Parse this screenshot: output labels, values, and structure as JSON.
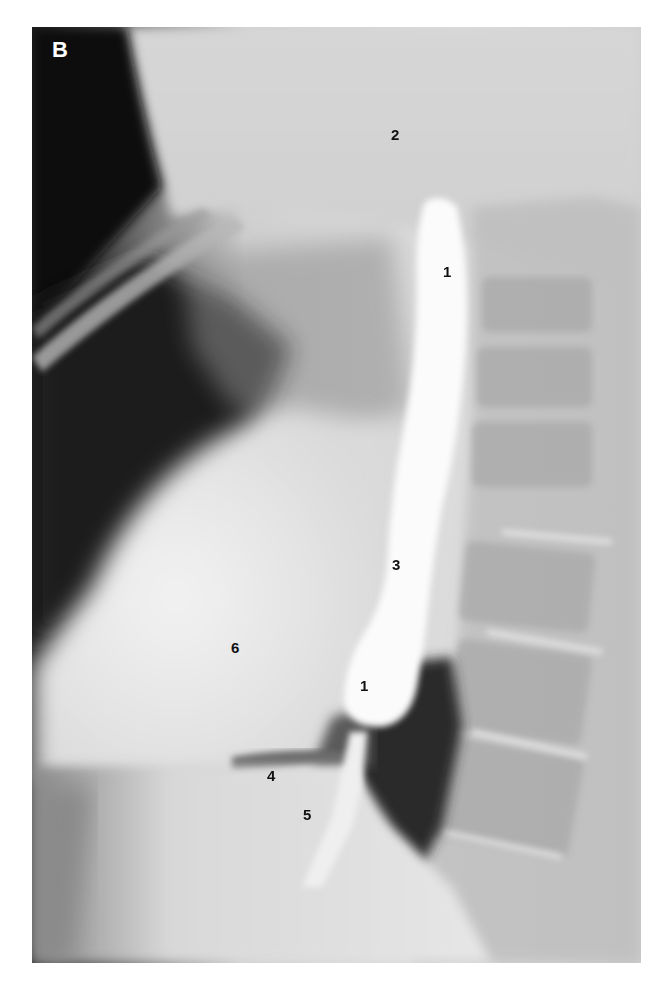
{
  "figure": {
    "panel_label": "B",
    "labels": [
      {
        "text": "2",
        "x": 391,
        "y": 127
      },
      {
        "text": "1",
        "x": 443,
        "y": 264
      },
      {
        "text": "3",
        "x": 392,
        "y": 557
      },
      {
        "text": "6",
        "x": 231,
        "y": 640
      },
      {
        "text": "1",
        "x": 360,
        "y": 678
      },
      {
        "text": "4",
        "x": 267,
        "y": 768
      },
      {
        "text": "5",
        "x": 303,
        "y": 807
      }
    ],
    "colors": {
      "background": "#ffffff",
      "film_dark": "#0d0d0d",
      "film_mid": "#9a9a9a",
      "film_light": "#ececec",
      "barium": "#fbfbfb",
      "label_text": "#111111",
      "panel_label_text": "#ffffff"
    }
  }
}
